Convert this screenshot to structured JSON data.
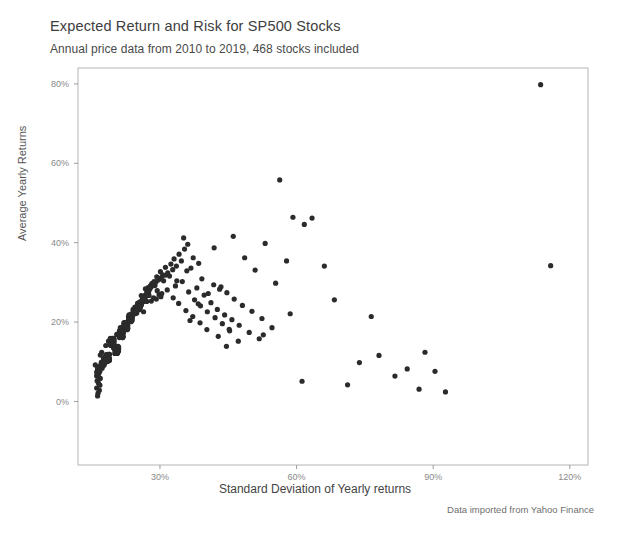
{
  "chart_data": {
    "type": "scatter",
    "title": "Expected Return and Risk for SP500 Stocks",
    "subtitle": "Annual price data from 2010 to 2019, 468 stocks included",
    "caption": "Data imported from Yahoo Finance",
    "xlabel": "Standard Deviation of Yearly returns",
    "ylabel": "Average Yearly Returns",
    "xlim": [
      12,
      124
    ],
    "ylim": [
      -16,
      84
    ],
    "xticks": [
      30,
      60,
      90,
      120
    ],
    "xtick_labels": [
      "30%",
      "60%",
      "90%",
      "120%"
    ],
    "yticks": [
      0,
      20,
      40,
      60,
      80
    ],
    "ytick_labels": [
      "0%",
      "20%",
      "40%",
      "60%",
      "80%"
    ],
    "grid": false,
    "legend": null,
    "n_points": 468,
    "point_color": "#2b2b2b",
    "point_radius": 2.6,
    "background": "#ffffff",
    "panel_border_color": "#b4b4b4",
    "axis_color": "#9b9b9b",
    "tick_label_color": "#8a8a8a",
    "series": [
      {
        "name": "SP500 stocks",
        "x": [
          17.2,
          19.4,
          15.8,
          21.3,
          23.6,
          18.1,
          20.5,
          24.8,
          16.9,
          22.4,
          25.1,
          19.8,
          17.6,
          26.3,
          21.9,
          23.1,
          18.7,
          20.2,
          24.1,
          22.8,
          16.4,
          27.5,
          19.1,
          25.6,
          21.4,
          23.9,
          17.9,
          20.8,
          26.8,
          22.1,
          18.4,
          24.5,
          19.6,
          21.7,
          25.9,
          23.4,
          16.1,
          28.2,
          20.1,
          22.6,
          17.4,
          26.1,
          24.3,
          19.2,
          21.1,
          23.7,
          18.9,
          25.3,
          27.1,
          20.6,
          22.3,
          16.7,
          24.9,
          19.9,
          21.6,
          26.5,
          23.2,
          18.2,
          28.7,
          20.9,
          22.9,
          17.1,
          25.8,
          19.4,
          21.8,
          24.2,
          27.9,
          18.6,
          23.5,
          20.3,
          22.7,
          16.3,
          26.9,
          19.7,
          21.2,
          25.4,
          29.3,
          18.8,
          23.8,
          20.7,
          22.2,
          17.7,
          24.6,
          19.3,
          30.1,
          21.5,
          26.2,
          23.3,
          18.3,
          20.4,
          28.1,
          22.5,
          17.3,
          25.7,
          19.5,
          21.9,
          24.7,
          31.2,
          18.1,
          23.6,
          20.8,
          22.4,
          16.6,
          27.3,
          19.8,
          21.3,
          25.1,
          29.8,
          18.5,
          23.9,
          20.2,
          22.8,
          17.5,
          26.6,
          19.1,
          32.4,
          21.7,
          24.4,
          28.5,
          18.7,
          23.1,
          20.5,
          22.1,
          16.9,
          25.5,
          19.6,
          21.4,
          27.7,
          30.6,
          18.4,
          23.7,
          20.9,
          22.6,
          17.2,
          26.4,
          19.3,
          33.1,
          21.1,
          24.8,
          29.1,
          18.9,
          23.4,
          20.6,
          22.3,
          16.2,
          25.9,
          19.9,
          21.8,
          28.3,
          31.7,
          18.2,
          23.2,
          20.1,
          22.9,
          17.8,
          26.7,
          19.4,
          34.2,
          21.6,
          24.1,
          30.3,
          18.6,
          23.8,
          20.3,
          22.7,
          16.5,
          25.2,
          19.7,
          21.2,
          27.4,
          32.8,
          18.1,
          23.5,
          20.8,
          22.4,
          17.6,
          26.1,
          19.2,
          35.4,
          21.9,
          24.9,
          29.6,
          18.8,
          23.3,
          20.7,
          22.2,
          16.8,
          25.6,
          19.5,
          21.5,
          28.9,
          33.6,
          18.3,
          23.1,
          20.4,
          22.8,
          17.4,
          26.9,
          19.8,
          36.1,
          21.3,
          24.5,
          31.1,
          18.5,
          23.9,
          20.2,
          22.5,
          16.1,
          25.3,
          19.1,
          21.7,
          27.8,
          34.7,
          18.9,
          23.6,
          20.9,
          22.1,
          17.9,
          26.3,
          19.6,
          37.3,
          21.4,
          24.2,
          30.8,
          18.4,
          23.4,
          20.5,
          22.9,
          16.7,
          25.8,
          19.3,
          21.1,
          28.6,
          35.9,
          18.7,
          23.7,
          20.1,
          22.6,
          17.1,
          26.8,
          19.9,
          38.5,
          21.8,
          24.6,
          32.1,
          18.2,
          23.2,
          20.6,
          22.3,
          16.4,
          25.4,
          19.4,
          21.6,
          29.4,
          36.8,
          18.6,
          23.5,
          20.8,
          22.7,
          17.7,
          26.5,
          19.2,
          39.2,
          21.2,
          24.3,
          33.4,
          18.8,
          23.8,
          20.3,
          22.4,
          16.3,
          25.7,
          19.7,
          21.9,
          30.2,
          38.1,
          18.1,
          23.3,
          20.7,
          22.8,
          17.3,
          26.2,
          19.5,
          40.6,
          21.5,
          24.7,
          34.9,
          18.9,
          23.6,
          20.4,
          22.1,
          16.6,
          25.1,
          19.8,
          21.3,
          31.6,
          39.7,
          18.3,
          23.9,
          20.9,
          22.5,
          17.8,
          26.6,
          19.1,
          41.8,
          21.7,
          24.4,
          36.3,
          18.5,
          23.1,
          20.2,
          22.9,
          16.9,
          25.9,
          19.6,
          21.8,
          32.9,
          41.2,
          18.7,
          23.4,
          20.6,
          22.2,
          17.5,
          27.1,
          19.3,
          43.1,
          21.4,
          24.8,
          37.6,
          18.2,
          23.7,
          20.5,
          22.6,
          16.2,
          25.5,
          19.9,
          21.1,
          34.1,
          42.6,
          18.6,
          23.2,
          20.8,
          22.4,
          17.2,
          27.6,
          19.4,
          44.7,
          21.6,
          24.1,
          38.9,
          18.4,
          23.5,
          20.1,
          22.7,
          16.5,
          25.2,
          19.2,
          21.9,
          35.7,
          44.2,
          18.8,
          23.8,
          20.7,
          22.3,
          17.6,
          28.1,
          19.7,
          46.3,
          21.2,
          24.5,
          40.4,
          18.1,
          23.3,
          20.3,
          22.8,
          16.8,
          25.6,
          19.5,
          21.5,
          37.2,
          45.8,
          18.3,
          23.6,
          20.9,
          22.1,
          17.9,
          28.6,
          19.8,
          48.1,
          21.8,
          24.9,
          42.1,
          18.9,
          23.1,
          20.4,
          22.5,
          16.1,
          25.8,
          19.1,
          21.7,
          38.8,
          47.4,
          18.5,
          23.9,
          20.2,
          22.9,
          17.4,
          29.2,
          19.6,
          50.2,
          21.3,
          24.2,
          43.7,
          18.7,
          23.4,
          20.6,
          22.2,
          16.7,
          25.3,
          19.3,
          21.4,
          40.3,
          49.6,
          18.2,
          23.7,
          20.8,
          22.6,
          17.1,
          29.8,
          19.9,
          52.4,
          21.9,
          24.6,
          45.3,
          18.6,
          23.2,
          20.5,
          22.4,
          16.4,
          25.7,
          19.4,
          21.6,
          42.8,
          51.8,
          18.4,
          23.5,
          20.1,
          22.8,
          17.7,
          30.4,
          19.2,
          54.6,
          21.1,
          24.3,
          47.2,
          18.8,
          23.8,
          20.7,
          22.3,
          16.3,
          26.4,
          19.7,
          21.2,
          44.6,
          56.3,
          35.2,
          41.9,
          33.7,
          48.6,
          53.1,
          38.4,
          46.1,
          57.8,
          50.9,
          43.4,
          36.6,
          59.2,
          55.4,
          61.7,
          45.2,
          63.4,
          52.7,
          58.6,
          66.1,
          68.3,
          71.2,
          73.8,
          76.4,
          78.1,
          81.6,
          84.3,
          86.9,
          88.2,
          90.4,
          92.7,
          113.6,
          115.8,
          61.2
        ],
        "y": [
          12.4,
          15.8,
          9.2,
          18.6,
          21.3,
          14.1,
          16.9,
          23.4,
          11.7,
          19.8,
          24.6,
          13.5,
          10.8,
          26.1,
          17.4,
          20.2,
          15.2,
          12.9,
          22.7,
          18.1,
          8.6,
          27.3,
          14.8,
          25.1,
          16.3,
          21.9,
          11.2,
          13.7,
          28.4,
          19.4,
          10.1,
          23.8,
          15.6,
          17.8,
          26.7,
          20.8,
          7.4,
          29.6,
          12.1,
          18.9,
          9.8,
          25.4,
          22.1,
          14.3,
          16.7,
          21.2,
          11.9,
          24.3,
          27.8,
          13.2,
          19.1,
          8.1,
          23.1,
          15.1,
          17.2,
          26.4,
          20.6,
          10.4,
          30.2,
          12.7,
          18.4,
          9.3,
          24.9,
          14.6,
          16.1,
          22.4,
          29.1,
          11.4,
          21.7,
          13.9,
          18.8,
          7.8,
          26.9,
          15.3,
          17.6,
          23.6,
          31.4,
          10.7,
          20.4,
          12.3,
          19.2,
          9.1,
          22.9,
          14.9,
          32.7,
          16.8,
          25.2,
          21.1,
          11.1,
          13.4,
          28.9,
          18.2,
          8.4,
          24.1,
          15.7,
          17.1,
          23.3,
          33.8,
          10.2,
          20.9,
          12.6,
          19.6,
          7.2,
          27.6,
          14.4,
          16.4,
          24.7,
          30.8,
          11.6,
          21.4,
          13.1,
          18.7,
          9.6,
          26.2,
          15.9,
          34.6,
          17.3,
          22.6,
          29.4,
          10.9,
          20.1,
          12.8,
          19.4,
          8.9,
          23.9,
          14.2,
          16.6,
          28.2,
          31.9,
          11.3,
          21.6,
          13.6,
          18.3,
          9.4,
          25.8,
          15.4,
          35.9,
          17.7,
          22.8,
          30.1,
          10.6,
          20.7,
          12.2,
          19.8,
          6.8,
          24.4,
          14.7,
          16.2,
          29.7,
          32.4,
          11.8,
          21.2,
          13.8,
          18.6,
          9.9,
          26.6,
          15.1,
          37.1,
          17.9,
          23.2,
          31.2,
          10.3,
          20.3,
          12.4,
          19.1,
          8.2,
          24.8,
          14.1,
          16.9,
          28.7,
          33.2,
          11.5,
          21.8,
          13.3,
          18.9,
          9.7,
          25.6,
          15.8,
          38.4,
          17.4,
          22.3,
          30.6,
          10.8,
          20.6,
          12.9,
          19.3,
          7.6,
          24.2,
          14.5,
          16.4,
          29.2,
          34.1,
          11.2,
          21.4,
          13.7,
          18.1,
          9.2,
          26.8,
          15.6,
          39.6,
          17.8,
          22.9,
          31.8,
          10.4,
          20.8,
          12.1,
          19.7,
          6.4,
          23.7,
          14.8,
          16.7,
          28.4,
          35.4,
          11.9,
          21.1,
          13.4,
          18.8,
          9.8,
          25.1,
          15.2,
          36.2,
          17.6,
          22.1,
          30.4,
          10.1,
          20.2,
          12.7,
          19.2,
          8.7,
          24.6,
          14.3,
          16.1,
          29.8,
          32.9,
          11.7,
          21.9,
          13.9,
          18.4,
          9.1,
          26.3,
          15.9,
          34.8,
          17.2,
          22.7,
          31.6,
          10.6,
          20.4,
          12.3,
          19.6,
          7.9,
          23.4,
          14.6,
          16.8,
          27.9,
          33.6,
          11.4,
          21.3,
          13.2,
          18.2,
          9.5,
          25.9,
          15.3,
          30.9,
          17.9,
          22.4,
          29.1,
          10.9,
          20.9,
          12.6,
          19.4,
          8.3,
          24.9,
          14.9,
          16.3,
          26.4,
          28.6,
          11.1,
          21.7,
          13.5,
          18.7,
          9.3,
          25.4,
          15.7,
          27.2,
          17.1,
          22.2,
          30.2,
          10.7,
          20.1,
          12.8,
          19.9,
          6.1,
          23.8,
          14.4,
          16.6,
          28.1,
          26.8,
          11.6,
          21.6,
          13.1,
          18.3,
          9.6,
          25.7,
          15.4,
          29.4,
          17.7,
          22.6,
          27.6,
          10.2,
          20.7,
          12.2,
          19.1,
          5.8,
          24.3,
          14.7,
          16.2,
          26.1,
          24.9,
          11.8,
          21.1,
          13.8,
          18.9,
          9.4,
          25.2,
          15.1,
          28.3,
          17.3,
          22.8,
          25.6,
          10.5,
          20.5,
          12.5,
          19.8,
          5.2,
          23.1,
          14.2,
          16.9,
          24.7,
          23.2,
          11.3,
          21.8,
          13.6,
          18.6,
          9.9,
          26.7,
          15.8,
          27.4,
          17.6,
          22.3,
          24.1,
          10.1,
          20.3,
          12.9,
          19.2,
          4.6,
          23.6,
          14.1,
          16.4,
          22.9,
          21.8,
          11.7,
          21.4,
          13.3,
          18.1,
          9.2,
          25.3,
          15.6,
          25.8,
          17.8,
          22.1,
          22.6,
          10.8,
          20.6,
          12.4,
          19.4,
          4.1,
          23.9,
          14.8,
          16.7,
          21.4,
          20.6,
          11.2,
          21.2,
          13.7,
          18.8,
          9.7,
          26.1,
          15.2,
          24.2,
          17.4,
          22.9,
          21.1,
          10.3,
          20.8,
          12.7,
          19.6,
          3.4,
          24.4,
          14.3,
          16.1,
          19.8,
          19.2,
          11.9,
          21.6,
          13.4,
          18.4,
          9.1,
          25.8,
          15.9,
          22.7,
          17.2,
          22.4,
          19.6,
          10.6,
          20.2,
          12.1,
          19.3,
          2.8,
          23.3,
          14.6,
          16.8,
          18.1,
          17.4,
          11.5,
          21.9,
          13.9,
          18.7,
          9.8,
          26.9,
          15.5,
          20.9,
          17.9,
          22.7,
          17.8,
          10.4,
          20.9,
          12.3,
          19.7,
          2.1,
          23.7,
          14.9,
          16.3,
          16.4,
          15.8,
          11.1,
          21.5,
          13.2,
          18.2,
          9.5,
          27.2,
          15.7,
          18.6,
          17.5,
          22.2,
          15.2,
          10.9,
          20.4,
          12.6,
          19.5,
          1.4,
          22.6,
          14.5,
          16.5,
          13.9,
          55.8,
          41.2,
          38.7,
          30.4,
          36.2,
          39.8,
          24.6,
          41.6,
          35.4,
          33.1,
          28.9,
          20.4,
          46.4,
          29.8,
          44.6,
          18.2,
          46.2,
          16.8,
          22.1,
          34.1,
          25.6,
          4.2,
          9.8,
          21.4,
          11.6,
          6.4,
          8.2,
          3.1,
          12.4,
          7.6,
          2.4,
          79.8,
          34.2,
          5.1
        ]
      }
    ]
  }
}
